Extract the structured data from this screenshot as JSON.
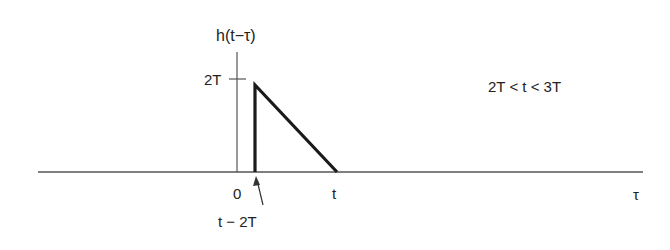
{
  "diagram": {
    "y_axis_label": "h(t−τ)",
    "x_axis_label": "τ",
    "y_tick_label": "2T",
    "x_tick_labels": {
      "origin": "0",
      "t": "t"
    },
    "annotation_arrow_label": "t − 2T",
    "condition": "2T < t < 3T",
    "shape": "right triangle from (t−2T, 2T) down to (t, 0)",
    "colors": {
      "axis": "#555555",
      "signal": "#1a1a1a"
    }
  }
}
